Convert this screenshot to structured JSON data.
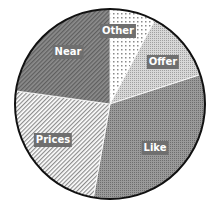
{
  "chart_data": {
    "type": "pie",
    "title": "",
    "start_angle_deg": 0,
    "direction": "clockwise",
    "slices": [
      {
        "label": "Other",
        "value": 7.8,
        "pattern": "dots",
        "label_pos": [
          118,
          31
        ]
      },
      {
        "label": "Offer",
        "value": 12.2,
        "pattern": "fine-dots",
        "label_pos": [
          163,
          62
        ]
      },
      {
        "label": "Like",
        "value": 32.8,
        "pattern": "dense-dots",
        "label_pos": [
          155,
          148
        ]
      },
      {
        "label": "Prices",
        "value": 24.4,
        "pattern": "light-diag",
        "label_pos": [
          53,
          140
        ]
      },
      {
        "label": "Near",
        "value": 22.8,
        "pattern": "dark-diag",
        "label_pos": [
          68,
          52
        ]
      }
    ],
    "legend": null,
    "center": [
      110,
      104
    ],
    "radius": 95
  },
  "labels": {
    "other": "Other",
    "offer": "Offer",
    "like": "Like",
    "prices": "Prices",
    "near": "Near"
  }
}
